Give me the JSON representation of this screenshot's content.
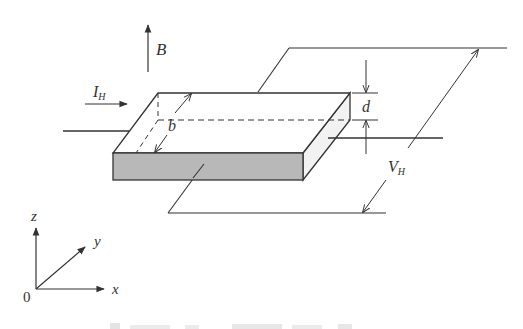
{
  "figure": {
    "type": "hall-effect-setup",
    "labels": {
      "magnetic_field": "B",
      "current": "I",
      "current_sub": "H",
      "width": "b",
      "thickness": "d",
      "hall_voltage": "V",
      "hall_voltage_sub": "H"
    },
    "axes": {
      "origin": "0",
      "x": "x",
      "y": "y",
      "z": "z"
    },
    "caption_truncated": true
  },
  "colors": {
    "line": "#333333",
    "front_face": "#b8b8b8",
    "side_face": "#f0f0f0",
    "top_face": "#ffffff"
  }
}
